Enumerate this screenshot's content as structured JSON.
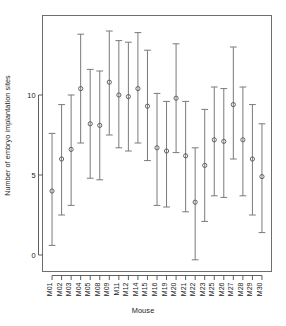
{
  "chart_data": {
    "type": "scatter",
    "title": "",
    "xlabel": "Mouse",
    "ylabel": "Number of embryo implantation sites",
    "ylim": [
      -0.6,
      14.2
    ],
    "yticks": [
      0,
      5,
      10
    ],
    "ytick_labels": [
      "0",
      "5",
      "10"
    ],
    "grid": false,
    "legend": null,
    "series_style": "point estimate with vertical confidence interval bars (open circle markers, capped whiskers)",
    "categories": [
      "M01",
      "M02",
      "M03",
      "M04",
      "M05",
      "M08",
      "M09",
      "M11",
      "M12",
      "M14",
      "M15",
      "M16",
      "M19",
      "M20",
      "M21",
      "M22",
      "M23",
      "M25",
      "M26",
      "M27",
      "M28",
      "M29",
      "M30"
    ],
    "values": [
      4.0,
      6.0,
      6.6,
      10.4,
      8.2,
      8.1,
      10.8,
      10.0,
      9.9,
      10.4,
      9.3,
      6.7,
      6.5,
      9.8,
      6.2,
      3.3,
      5.6,
      7.2,
      7.1,
      9.4,
      7.2,
      6.0,
      4.9
    ],
    "ci_lower": [
      0.6,
      2.5,
      3.1,
      7.0,
      4.8,
      4.7,
      7.5,
      6.7,
      6.5,
      7.0,
      5.9,
      3.1,
      3.0,
      6.4,
      2.7,
      -0.3,
      2.1,
      3.7,
      3.6,
      6.0,
      3.7,
      2.5,
      1.4
    ],
    "ci_upper": [
      7.6,
      9.4,
      10.0,
      13.8,
      11.6,
      11.5,
      14.0,
      13.4,
      13.3,
      13.9,
      12.8,
      10.1,
      9.6,
      13.2,
      9.6,
      6.7,
      9.1,
      10.5,
      10.4,
      13.0,
      10.5,
      9.4,
      8.2
    ]
  },
  "axes": {
    "ylabel": "Number of embryo implantation sites",
    "xlabel": "Mouse"
  }
}
